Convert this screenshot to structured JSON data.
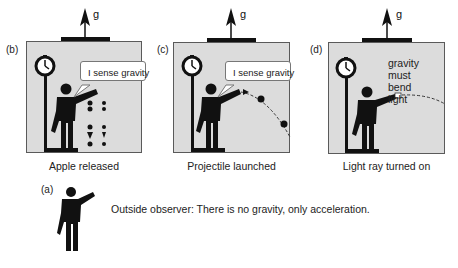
{
  "figure": {
    "acceleration_label": "g",
    "panels": [
      {
        "id": "b",
        "tag": "(b)",
        "caption": "Apple released",
        "speech": "I sense gravity",
        "content": "falling-apples"
      },
      {
        "id": "c",
        "tag": "(c)",
        "caption": "Projectile launched",
        "speech": "I sense gravity",
        "content": "projectile-trajectory"
      },
      {
        "id": "d",
        "tag": "(d)",
        "caption": "Light ray turned on",
        "thought": "gravity must bend light",
        "thought_lines": [
          "gravity must",
          "bend light"
        ],
        "content": "bent-light-ray"
      }
    ],
    "observer": {
      "tag": "(a)",
      "statement": "Outside observer: There is no gravity, only acceleration."
    }
  },
  "colors": {
    "box_fill": "#dcdcdc",
    "box_border": "#5a5a5a",
    "figure": "#111111",
    "roof": "#111111"
  }
}
